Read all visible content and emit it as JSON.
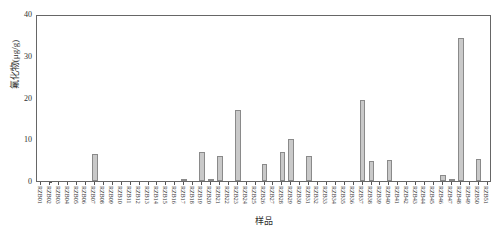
{
  "chart_data": {
    "type": "bar",
    "title": "",
    "xlabel": "样品",
    "ylabel": "氟化物(μg/g)",
    "ylim": [
      0,
      40
    ],
    "yticks": [
      0,
      10,
      20,
      30,
      40
    ],
    "grid": false,
    "legend": null,
    "bar_color": "#c9c9c9",
    "bar_edge_color": "#8a8a8a",
    "axis_color": "#666666",
    "categories": [
      "RZB01",
      "RZB02",
      "RZB03",
      "RZB04",
      "RZB05",
      "RZB06",
      "RZB07",
      "RZB08",
      "RZB09",
      "RZB10",
      "RZB11",
      "RZB12",
      "RZB13",
      "RZB14",
      "RZB15",
      "RZB16",
      "RZB17",
      "RZB18",
      "RZB19",
      "RZB20",
      "RZB21",
      "RZB22",
      "RZB23",
      "RZB24",
      "RZB25",
      "RZB26",
      "RZB27",
      "RZB28",
      "RZB29",
      "RZB30",
      "RZB31",
      "RZB32",
      "RZB33",
      "RZB34",
      "RZB35",
      "RZB36",
      "RZB37",
      "RZB38",
      "RZB39",
      "RZB40",
      "RZB41",
      "RZB42",
      "RZB43",
      "RZB44",
      "RZB45",
      "RZB46",
      "RZB47",
      "RZB48",
      "RZB49",
      "RZB50",
      "RZB51"
    ],
    "values": [
      0,
      0,
      0,
      0,
      0,
      0,
      6.5,
      0,
      0,
      0,
      0,
      0,
      0,
      0,
      0,
      0,
      0.6,
      0,
      7.0,
      0.6,
      6.0,
      0,
      17.0,
      0,
      0,
      4.0,
      0,
      7.0,
      10.0,
      0,
      6.0,
      0,
      0,
      0,
      0,
      0,
      19.5,
      4.7,
      0,
      5.0,
      0,
      0,
      0,
      0,
      0,
      1.4,
      0.6,
      34.3,
      0,
      5.3,
      0
    ]
  },
  "figure": {
    "top_strip_text": ""
  }
}
